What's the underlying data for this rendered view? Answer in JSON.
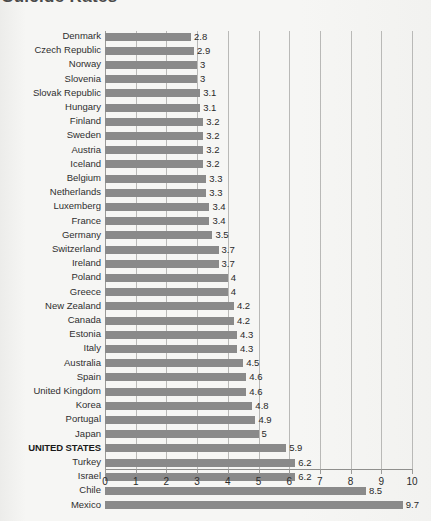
{
  "title": "Suicide Rates",
  "chart_data": {
    "type": "bar",
    "orientation": "horizontal",
    "title": "Suicide Rates",
    "xlabel": "",
    "ylabel": "",
    "xlim": [
      0,
      10
    ],
    "xticks": [
      "0",
      "1",
      "2",
      "3",
      "4",
      "5",
      "6",
      "7",
      "8",
      "9",
      "10"
    ],
    "grid": true,
    "legend": null,
    "highlight_category": "UNITED STATES",
    "bar_color": "#8a8a8a",
    "categories": [
      "Denmark",
      "Czech Republic",
      "Norway",
      "Slovenia",
      "Slovak Republic",
      "Hungary",
      "Finland",
      "Sweden",
      "Austria",
      "Iceland",
      "Belgium",
      "Netherlands",
      "Luxemberg",
      "France",
      "Germany",
      "Switzerland",
      "Ireland",
      "Poland",
      "Greece",
      "New Zealand",
      "Canada",
      "Estonia",
      "Italy",
      "Australia",
      "Spain",
      "United Kingdom",
      "Korea",
      "Portugal",
      "Japan",
      "UNITED STATES",
      "Turkey",
      "Israel",
      "Chile",
      "Mexico"
    ],
    "values": [
      2.8,
      2.9,
      3,
      3,
      3.1,
      3.1,
      3.2,
      3.2,
      3.2,
      3.2,
      3.3,
      3.3,
      3.4,
      3.4,
      3.5,
      3.7,
      3.7,
      4,
      4,
      4.2,
      4.2,
      4.3,
      4.3,
      4.5,
      4.6,
      4.6,
      4.8,
      4.9,
      5,
      5.9,
      6.2,
      6.2,
      8.5,
      9.7
    ],
    "value_labels": [
      "2.8",
      "2.9",
      "3",
      "3",
      "3.1",
      "3.1",
      "3.2",
      "3.2",
      "3.2",
      "3.2",
      "3.3",
      "3.3",
      "3.4",
      "3.4",
      "3.5",
      "3.7",
      "3.7",
      "4",
      "4",
      "4.2",
      "4.2",
      "4.3",
      "4.3",
      "4.5",
      "4.6",
      "4.6",
      "4.8",
      "4.9",
      "5",
      "5.9",
      "6.2",
      "6.2",
      "8.5",
      "9.7"
    ]
  }
}
